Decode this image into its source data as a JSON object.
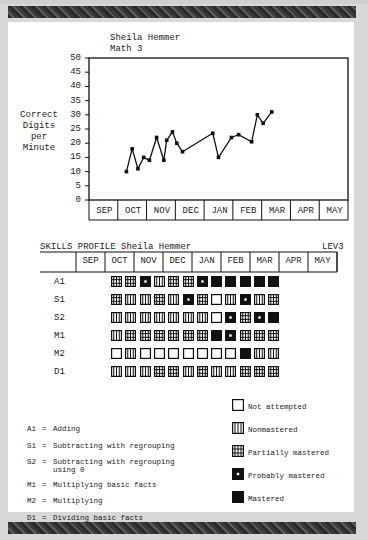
{
  "header": {
    "student_name": "Sheila Hemmer",
    "subject": "Math 3"
  },
  "chart_data": {
    "type": "line",
    "xlabel": "",
    "ylabel": "Correct Digits per Minute",
    "ylim": [
      0,
      50
    ],
    "yticks": [
      0,
      5,
      10,
      15,
      20,
      25,
      30,
      35,
      40,
      45,
      50
    ],
    "categories": [
      "SEP",
      "OCT",
      "NOV",
      "DEC",
      "JAN",
      "FEB",
      "MAR",
      "APR",
      "MAY"
    ],
    "grid": false,
    "series": [
      {
        "name": "Correct Digits per Minute",
        "points": [
          {
            "month": "OCT",
            "pos": 1.3,
            "value": 10
          },
          {
            "month": "OCT",
            "pos": 1.5,
            "value": 18
          },
          {
            "month": "OCT",
            "pos": 1.7,
            "value": 11
          },
          {
            "month": "OCT",
            "pos": 1.9,
            "value": 15
          },
          {
            "month": "NOV",
            "pos": 2.1,
            "value": 14
          },
          {
            "month": "NOV",
            "pos": 2.35,
            "value": 22
          },
          {
            "month": "NOV",
            "pos": 2.6,
            "value": 14
          },
          {
            "month": "NOV",
            "pos": 2.7,
            "value": 21
          },
          {
            "month": "NOV",
            "pos": 2.9,
            "value": 24
          },
          {
            "month": "DEC",
            "pos": 3.05,
            "value": 20
          },
          {
            "month": "DEC",
            "pos": 3.25,
            "value": 17
          },
          {
            "month": "JAN",
            "pos": 4.3,
            "value": 23.5
          },
          {
            "month": "JAN",
            "pos": 4.5,
            "value": 15
          },
          {
            "month": "FEB",
            "pos": 4.95,
            "value": 22
          },
          {
            "month": "FEB",
            "pos": 5.2,
            "value": 23
          },
          {
            "month": "FEB",
            "pos": 5.65,
            "value": 20.5
          },
          {
            "month": "MAR",
            "pos": 5.85,
            "value": 30
          },
          {
            "month": "MAR",
            "pos": 6.05,
            "value": 27
          },
          {
            "month": "MAR",
            "pos": 6.35,
            "value": 31
          }
        ]
      }
    ]
  },
  "skills_profile": {
    "title": "SKILLS PROFILE Sheila Hemmer",
    "level": "LEV3",
    "months": [
      "SEP",
      "OCT",
      "NOV",
      "DEC",
      "JAN",
      "FEB",
      "MAR",
      "APR",
      "MAY"
    ],
    "rows": [
      {
        "code": "A1",
        "cells": [
          "P",
          "P",
          "Pr",
          "N",
          "P",
          "P",
          "Pr",
          "M",
          "M",
          "M",
          "M",
          "M"
        ]
      },
      {
        "code": "S1",
        "cells": [
          "P",
          "N",
          "N",
          "P",
          "N",
          "Pr",
          "P",
          "Na",
          "N",
          "Pr",
          "N",
          "P"
        ]
      },
      {
        "code": "S2",
        "cells": [
          "N",
          "N",
          "N",
          "N",
          "N",
          "N",
          "N",
          "Na",
          "Pr",
          "P",
          "Pr",
          "M"
        ]
      },
      {
        "code": "M1",
        "cells": [
          "N",
          "P",
          "P",
          "P",
          "P",
          "P",
          "P",
          "M",
          "Pr",
          "P",
          "P",
          "P"
        ]
      },
      {
        "code": "M2",
        "cells": [
          "Na",
          "N",
          "Na",
          "Na",
          "Na",
          "Na",
          "Na",
          "Na",
          "Na",
          "M",
          "N",
          "N"
        ]
      },
      {
        "code": "D1",
        "cells": [
          "N",
          "N",
          "N",
          "P",
          "P",
          "N",
          "P",
          "N",
          "N",
          "P",
          "P",
          "P"
        ]
      }
    ]
  },
  "skills_key": [
    {
      "code": "A1",
      "label": "Adding"
    },
    {
      "code": "S1",
      "label": "Subtracting with regrouping"
    },
    {
      "code": "S2",
      "label": "Subtracting with regrouping",
      "label2": "using 0"
    },
    {
      "code": "M1",
      "label": "Multiplying basic facts"
    },
    {
      "code": "M2",
      "label": "Multiplying"
    },
    {
      "code": "D1",
      "label": "Dividing basic facts"
    }
  ],
  "legend": [
    {
      "key": "Na",
      "label": "Not attempted"
    },
    {
      "key": "N",
      "label": "Nonmastered"
    },
    {
      "key": "P",
      "label": "Partially mastered"
    },
    {
      "key": "Pr",
      "label": "Probably mastered"
    },
    {
      "key": "M",
      "label": "Mastered"
    }
  ],
  "ylabel_lines": [
    "Correct",
    "Digits",
    "per",
    "Minute"
  ],
  "equals": "="
}
